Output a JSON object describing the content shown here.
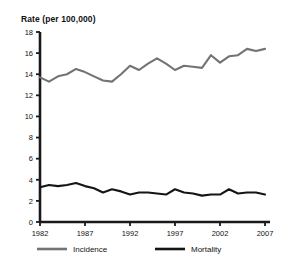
{
  "chart_data": {
    "type": "line",
    "title": "Rate (per 100,000)",
    "xlabel": "",
    "ylabel": "Rate (per 100,000)",
    "ylim": [
      0,
      18
    ],
    "xlim": [
      1982,
      2007
    ],
    "ytick_step": 2,
    "yticks": [
      0,
      2,
      4,
      6,
      8,
      10,
      12,
      14,
      16,
      18
    ],
    "xticks": [
      1982,
      1987,
      1992,
      1997,
      2002,
      2007
    ],
    "xtick_labels": [
      "1982",
      "1987",
      "1992",
      "1997",
      "2002",
      "2007"
    ],
    "ytick_labels": [
      "0",
      "2",
      "4",
      "6",
      "8",
      "10",
      "12",
      "14",
      "16",
      "18"
    ],
    "grid": false,
    "legend_position": "bottom",
    "x": [
      1982,
      1983,
      1984,
      1985,
      1986,
      1987,
      1988,
      1989,
      1990,
      1991,
      1992,
      1993,
      1994,
      1995,
      1996,
      1997,
      1998,
      1999,
      2000,
      2001,
      2002,
      2003,
      2004,
      2005,
      2006,
      2007
    ],
    "series": [
      {
        "name": "Incidence",
        "color": "#737373",
        "values": [
          13.7,
          13.3,
          13.8,
          14.0,
          14.5,
          14.2,
          13.8,
          13.4,
          13.3,
          14.0,
          14.8,
          14.4,
          15.0,
          15.5,
          15.0,
          14.4,
          14.8,
          14.7,
          14.6,
          15.8,
          15.1,
          15.7,
          15.8,
          16.4,
          16.2,
          16.4
        ]
      },
      {
        "name": "Mortality",
        "color": "#151515",
        "values": [
          3.3,
          3.5,
          3.4,
          3.5,
          3.7,
          3.4,
          3.2,
          2.8,
          3.1,
          2.9,
          2.6,
          2.8,
          2.8,
          2.7,
          2.6,
          3.1,
          2.8,
          2.7,
          2.5,
          2.6,
          2.6,
          3.1,
          2.7,
          2.8,
          2.8,
          2.6
        ]
      }
    ]
  },
  "legend": {
    "items": [
      {
        "label": "Incidence",
        "color": "#737373"
      },
      {
        "label": "Mortality",
        "color": "#151515"
      }
    ]
  },
  "axis": {
    "line_color": "#1a1a1a"
  }
}
